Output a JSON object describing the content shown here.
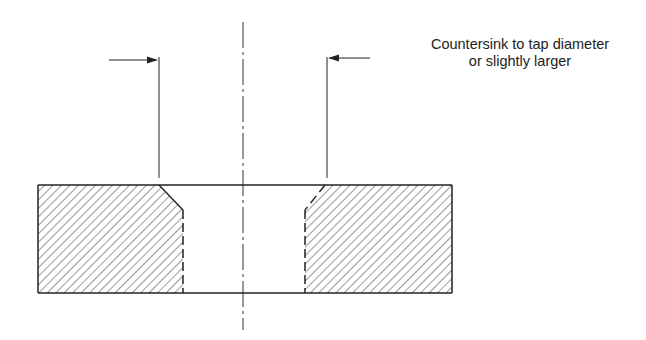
{
  "diagram": {
    "type": "cross-section",
    "annotation": {
      "line1": "Countersink to tap diameter",
      "line2": "or slightly larger"
    },
    "colors": {
      "line": "#222222",
      "hatch": "#444444",
      "background": "#ffffff"
    }
  }
}
